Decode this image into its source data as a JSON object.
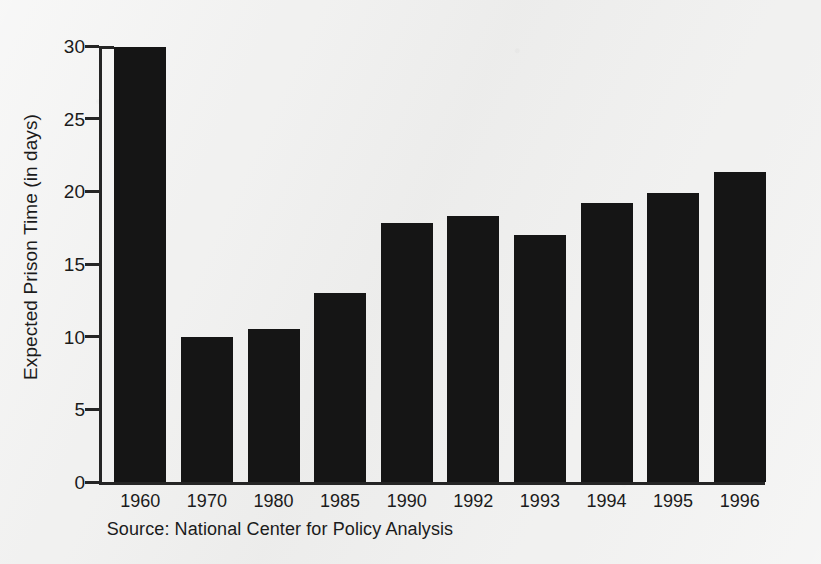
{
  "chart_data": {
    "type": "bar",
    "title": "",
    "subtitle": "",
    "xlabel": "",
    "ylabel": "Expected Prison Time (in days)",
    "categories": [
      "1960",
      "1970",
      "1980",
      "1985",
      "1990",
      "1992",
      "1993",
      "1994",
      "1995",
      "1996"
    ],
    "values": [
      29.9,
      10.0,
      10.5,
      13.0,
      17.8,
      18.3,
      17.0,
      19.2,
      19.9,
      21.3
    ],
    "series": [
      {
        "name": "Expected Prison Time",
        "values": [
          29.9,
          10.0,
          10.5,
          13.0,
          17.8,
          18.3,
          17.0,
          19.2,
          19.9,
          21.3
        ]
      }
    ],
    "ylim": [
      0,
      30
    ],
    "ytick_values": [
      0,
      5,
      10,
      15,
      20,
      25,
      30
    ],
    "ytick_labels": [
      "0",
      "5",
      "10",
      "15",
      "20",
      "25",
      "30"
    ],
    "grid": false,
    "legend": false,
    "legend_position": "none",
    "bar_color": "#151515",
    "background_color": "#f1f1f0",
    "axis_color": "#252525",
    "annotations": []
  },
  "source": {
    "caption": "Source: National Center for Policy Analysis"
  }
}
